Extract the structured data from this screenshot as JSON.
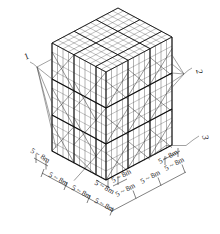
{
  "figure": {
    "kind": "isometric-engineering-diagram",
    "colors": {
      "line": "#3a3a3a",
      "line_bold": "#111111",
      "leader": "#555555",
      "text": "#1a1a1a",
      "background": "#ffffff"
    }
  },
  "callouts": [
    {
      "id": "1",
      "label": "1",
      "side": "left",
      "anchor_x": 95,
      "anchor_y": 72
    },
    {
      "id": "2",
      "label": "2",
      "side": "right",
      "anchor_x": 176,
      "anchor_y": 78
    },
    {
      "id": "3",
      "label": "3",
      "side": "right",
      "anchor_x": 185,
      "anchor_y": 143
    }
  ],
  "dimensions": {
    "spacing_text": "5 ~ 8m",
    "left_axis": [
      {
        "label": "5 ~ 8m"
      },
      {
        "label": "5 ~ 8m"
      },
      {
        "label": "5 ~ 8m"
      }
    ],
    "right_axis": [
      {
        "label": "5 ~ 8m"
      },
      {
        "label": "5 ~ 8m"
      },
      {
        "label": "5 ~ 8m"
      }
    ],
    "near_left_short": "5 ~ 8m",
    "near_right_short": "5 ~ 8m"
  },
  "structure": {
    "bays_x": 3,
    "bays_y": 3,
    "lifts": 3,
    "sub_divisions_per_bay": 4,
    "sub_lifts_per_tier": 4,
    "bracing": "X-bracing on faces, diagonal lattice on top deck"
  }
}
